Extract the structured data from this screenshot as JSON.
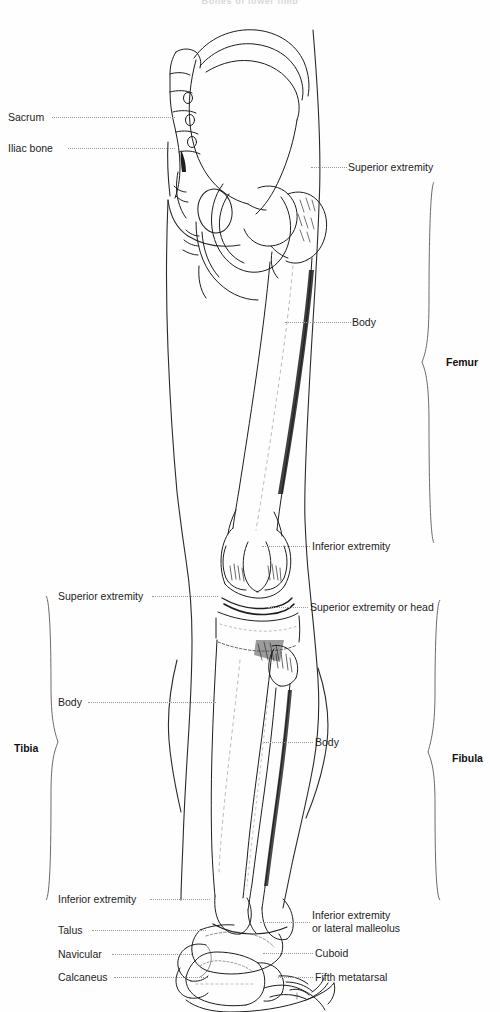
{
  "figure": {
    "title": "Bones of lower limb",
    "width": 500,
    "height": 1012,
    "ink_color": "#1d1d1d",
    "leader_color": "#9a9a9a",
    "background": "#ffffff"
  },
  "labels_left": [
    {
      "text": "Sacrum",
      "x": 8,
      "y": 111,
      "leader_x": 52,
      "leader_w": 123
    },
    {
      "text": "Iliac bone",
      "x": 8,
      "y": 142,
      "leader_x": 68,
      "leader_w": 105
    },
    {
      "text": "Superior extremity",
      "x": 58,
      "y": 590,
      "leader_x": 150,
      "leader_w": 35
    },
    {
      "text": "Body",
      "x": 58,
      "y": 696,
      "leader_x": 86,
      "leader_w": 105
    },
    {
      "text": "Inferior extremity",
      "x": 58,
      "y": 893,
      "leader_x": 148,
      "leader_w": 38
    },
    {
      "text": "Talus",
      "x": 58,
      "y": 924,
      "leader_x": 90,
      "leader_w": 96
    },
    {
      "text": "Navicular",
      "x": 58,
      "y": 948,
      "leader_x": 110,
      "leader_w": 78
    },
    {
      "text": "Calcaneus",
      "x": 58,
      "y": 971,
      "leader_x": 112,
      "leader_w": 78
    }
  ],
  "labels_right": [
    {
      "text": "Superior extremity",
      "x": 348,
      "y": 161,
      "leader_x": 311,
      "leader_w": 34
    },
    {
      "text": "Body",
      "x": 352,
      "y": 316,
      "leader_x": 295,
      "leader_w": 54
    },
    {
      "text": "Inferior extremity",
      "x": 312,
      "y": 540,
      "leader_x": 264,
      "leader_w": 45
    },
    {
      "text": "Superior extremity or head",
      "x": 310,
      "y": 601,
      "leader_x": 270,
      "leader_w": 37
    },
    {
      "text": "Body",
      "x": 315,
      "y": 736,
      "leader_x": 266,
      "leader_w": 46
    },
    {
      "text": "Cuboid",
      "x": 315,
      "y": 947,
      "leader_x": 265,
      "leader_w": 46
    },
    {
      "text": "Fifth metatarsal",
      "x": 315,
      "y": 971,
      "leader_x": 280,
      "leader_w": 32
    }
  ],
  "labels_right_multiline": [
    {
      "line1": "Inferior extremity",
      "line2": "or lateral malleolus",
      "x": 312,
      "y": 909,
      "leader_x": 262,
      "leader_w": 46,
      "leader_y": 922
    }
  ],
  "braces": [
    {
      "name": "Femur",
      "side": "right",
      "label_x": 446,
      "label_y": 356,
      "top": 182,
      "bottom": 543,
      "axis_x": 432
    },
    {
      "name": "Tibia",
      "side": "left",
      "label_x": 14,
      "label_y": 742,
      "top": 596,
      "bottom": 900,
      "axis_x": 48
    },
    {
      "name": "Fibula",
      "side": "right",
      "label_x": 452,
      "label_y": 752,
      "top": 600,
      "bottom": 900,
      "axis_x": 438
    }
  ],
  "anatomy_regions": [
    "pelvis-sacrum-ilium",
    "hip-joint-acetabulum",
    "femur-shaft",
    "knee-joint-condyles",
    "tibia-shaft",
    "fibula-shaft",
    "ankle-joint-malleolus",
    "foot-tarsals-metatarsals"
  ]
}
